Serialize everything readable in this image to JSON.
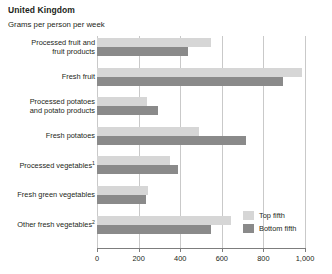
{
  "header": {
    "title": "United Kingdom",
    "subtitle": "Grams per person per week"
  },
  "legend": {
    "position": "bottom-right",
    "items": [
      {
        "label": "Top fifth",
        "color": "#d6d6d6"
      },
      {
        "label": "Bottom fifth",
        "color": "#8a8a8a"
      }
    ]
  },
  "axis": {
    "ticks": [
      "0",
      "200",
      "400",
      "600",
      "800",
      "1,000"
    ],
    "tick_values": [
      0,
      200,
      400,
      600,
      800,
      1000
    ]
  },
  "chart_data": {
    "type": "bar",
    "orientation": "horizontal",
    "title": "United Kingdom",
    "subtitle": "Grams per person per week",
    "xlabel": "Grams per person per week",
    "ylabel": "",
    "xlim": [
      0,
      1000
    ],
    "grid": true,
    "legend_position": "bottom-right",
    "categories": [
      "Processed fruit and\nfruit products",
      "Fresh fruit",
      "Processed potatoes\nand potato products",
      "Fresh potatoes",
      "Processed vegetables",
      "Fresh green vegetables",
      "Other fresh vegetables"
    ],
    "category_footnotes": [
      "",
      "",
      "",
      "",
      "1",
      "",
      "2"
    ],
    "series": [
      {
        "name": "Top fifth",
        "color": "#d6d6d6",
        "values": [
          548,
          985,
          240,
          490,
          350,
          245,
          645
        ]
      },
      {
        "name": "Bottom fifth",
        "color": "#8a8a8a",
        "values": [
          437,
          895,
          293,
          715,
          390,
          235,
          548
        ]
      }
    ]
  }
}
